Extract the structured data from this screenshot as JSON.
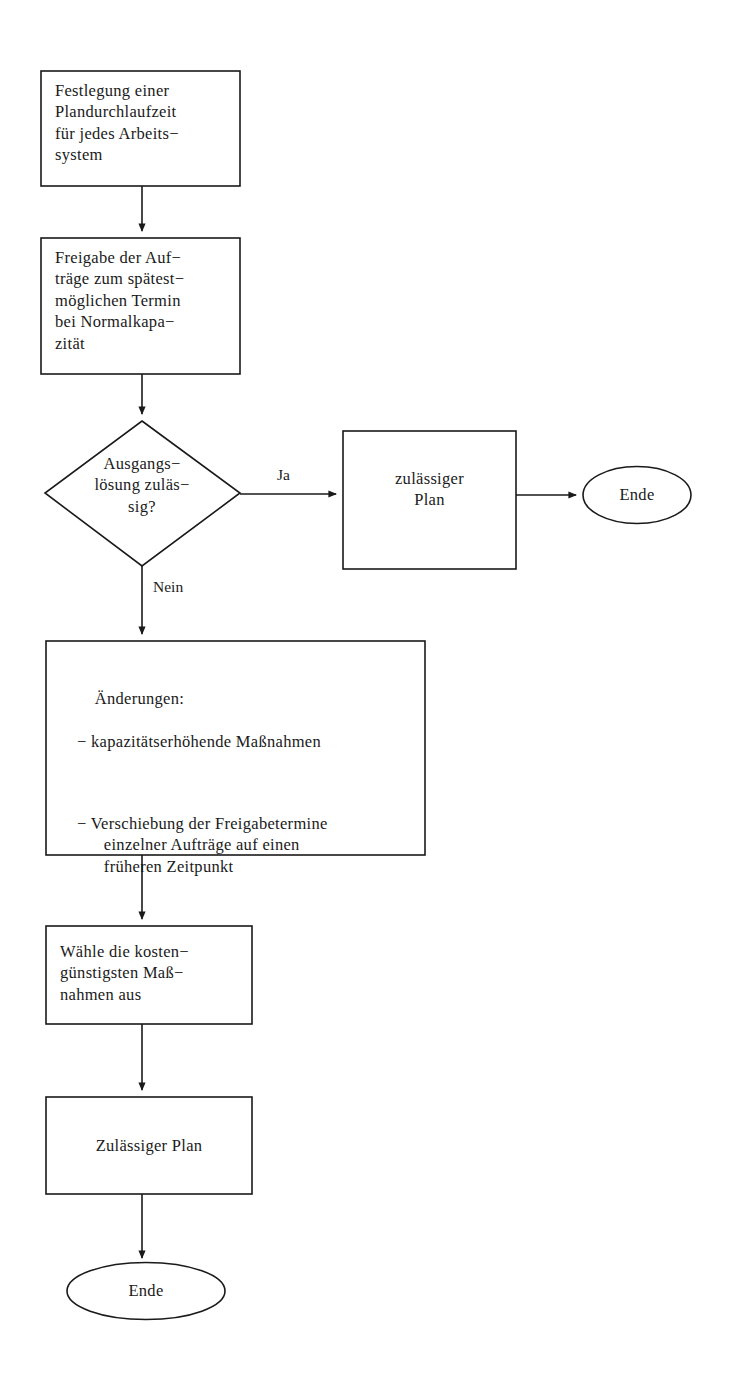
{
  "diagram": {
    "language": "de",
    "stroke_color": "#1a1a1a",
    "fill_color": "#ffffff",
    "background_color": "#ffffff"
  },
  "nodes": {
    "n1": {
      "type": "process",
      "lines": "Festlegung einer\nPlandurchlaufzeit\nfür jedes Arbeits−\nsystem"
    },
    "n2": {
      "type": "process",
      "lines": "Freigabe der Auf−\nträge zum spätest−\nmöglichen Termin\nbei Normalkapa−\nzität"
    },
    "n3": {
      "type": "decision",
      "lines": "Ausgangs−\nlösung zuläs−\nsig?"
    },
    "n4": {
      "type": "process",
      "lines": "zulässiger\nPlan"
    },
    "n5": {
      "type": "terminator",
      "label": "Ende"
    },
    "n6": {
      "type": "process",
      "heading": "Änderungen:",
      "bullets": [
        "− kapazitätserhöhende Maßnahmen",
        "− Verschiebung der Freigabetermine\n  einzelner Aufträge auf einen\n  früheren Zeitpunkt"
      ]
    },
    "n7": {
      "type": "process",
      "lines": "Wähle die kosten−\ngünstigsten Maß−\nnahmen aus"
    },
    "n8": {
      "type": "process",
      "lines": "Zulässiger Plan"
    },
    "n9": {
      "type": "terminator",
      "label": "Ende"
    }
  },
  "edges": {
    "e_yes_label": "Ja",
    "e_no_label": "Nein"
  }
}
